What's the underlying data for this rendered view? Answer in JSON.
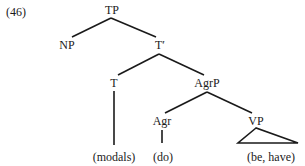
{
  "example_number": "(46)",
  "nodes": {
    "TP": "TP",
    "NP": "NP",
    "T_bar": "T′",
    "T": "T",
    "AgrP": "AgrP",
    "Agr": "Agr",
    "VP": "VP"
  },
  "leaves": {
    "T": "(modals)",
    "Agr": "(do)",
    "VP": "(be, have)"
  },
  "tree": {
    "label": "TP",
    "children": [
      {
        "label": "NP"
      },
      {
        "label": "T′",
        "children": [
          {
            "label": "T",
            "children": [
              {
                "label": "(modals)"
              }
            ]
          },
          {
            "label": "AgrP",
            "children": [
              {
                "label": "Agr",
                "children": [
                  {
                    "label": "(do)"
                  }
                ]
              },
              {
                "label": "VP",
                "triangle": true,
                "children": [
                  {
                    "label": "(be, have)"
                  }
                ]
              }
            ]
          }
        ]
      }
    ]
  }
}
